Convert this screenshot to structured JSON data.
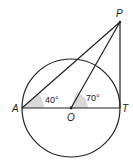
{
  "diagram": {
    "type": "geometry-circle-tangent",
    "points": {
      "A": {
        "label": "A",
        "x": 22,
        "y": 108
      },
      "O": {
        "label": "O",
        "x": 71,
        "y": 108
      },
      "T": {
        "label": "T",
        "x": 120,
        "y": 108
      },
      "P": {
        "label": "P",
        "x": 120,
        "y": 22
      }
    },
    "circle": {
      "center": "O",
      "cx": 71,
      "cy": 108,
      "r": 49
    },
    "segments": [
      "AT",
      "AP",
      "OP",
      "PT"
    ],
    "angles": [
      {
        "vertex": "A",
        "between": [
          "T",
          "P"
        ],
        "label": "40°"
      },
      {
        "vertex": "O",
        "between": [
          "T",
          "P"
        ],
        "label": "70°"
      }
    ],
    "colors": {
      "stroke": "#222222",
      "angle_fill": "#d9d9d9"
    }
  }
}
